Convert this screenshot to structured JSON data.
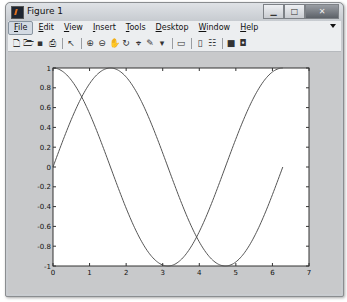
{
  "window": {
    "title": "Figure 1",
    "controls": {
      "minimize": "minimize-button",
      "maximize": "maximize-button",
      "close": "close-button"
    }
  },
  "menubar": {
    "items": [
      {
        "label": "File",
        "mnemonic": "F",
        "rest": "ile",
        "active": true
      },
      {
        "label": "Edit",
        "mnemonic": "E",
        "rest": "dit"
      },
      {
        "label": "View",
        "mnemonic": "V",
        "rest": "iew"
      },
      {
        "label": "Insert",
        "mnemonic": "I",
        "rest": "nsert"
      },
      {
        "label": "Tools",
        "mnemonic": "T",
        "rest": "ools"
      },
      {
        "label": "Desktop",
        "mnemonic": "D",
        "rest": "esktop"
      },
      {
        "label": "Window",
        "mnemonic": "W",
        "rest": "indow"
      },
      {
        "label": "Help",
        "mnemonic": "H",
        "rest": "elp"
      }
    ]
  },
  "toolbar": {
    "buttons": [
      {
        "name": "new-figure-icon",
        "glyph": "🗋"
      },
      {
        "name": "open-file-icon",
        "glyph": "🗁"
      },
      {
        "name": "save-figure-icon",
        "glyph": "▪"
      },
      {
        "name": "print-figure-icon",
        "glyph": "⎙"
      },
      {
        "sep": true
      },
      {
        "name": "edit-plot-icon",
        "glyph": "↖"
      },
      {
        "sep": true
      },
      {
        "name": "zoom-in-icon",
        "glyph": "⊕"
      },
      {
        "name": "zoom-out-icon",
        "glyph": "⊖"
      },
      {
        "name": "pan-icon",
        "glyph": "✋"
      },
      {
        "name": "rotate-3d-icon",
        "glyph": "↻"
      },
      {
        "name": "data-cursor-icon",
        "glyph": "⌖"
      },
      {
        "name": "brush-icon",
        "glyph": "✎"
      },
      {
        "name": "brush-dropdown-icon",
        "glyph": "▾"
      },
      {
        "sep": true
      },
      {
        "name": "link-plot-icon",
        "glyph": "▭"
      },
      {
        "sep": true
      },
      {
        "name": "insert-colorbar-icon",
        "glyph": "▯"
      },
      {
        "name": "insert-legend-icon",
        "glyph": "☷"
      },
      {
        "sep": true
      },
      {
        "name": "hide-plot-tools-icon",
        "glyph": "■"
      },
      {
        "name": "show-plot-tools-icon",
        "glyph": "◘"
      }
    ]
  },
  "chart_data": {
    "type": "line",
    "title": "",
    "xlabel": "",
    "ylabel": "",
    "xlim": [
      0,
      7
    ],
    "ylim": [
      -1,
      1
    ],
    "grid": false,
    "legend": null,
    "xticks": [
      "0",
      "1",
      "2",
      "3",
      "4",
      "5",
      "6",
      "7"
    ],
    "yticks": [
      "-1",
      "-0.8",
      "-0.6",
      "-0.4",
      "-0.2",
      "0",
      "0.2",
      "0.4",
      "0.6",
      "0.8",
      "1"
    ],
    "series": [
      {
        "name": "sin(x)",
        "x_range": [
          0,
          6.2832
        ],
        "x": [
          0,
          0.785,
          1.571,
          2.356,
          3.142,
          3.927,
          4.712,
          5.498,
          6.283
        ],
        "values": [
          0,
          0.707,
          1,
          0.707,
          0,
          -0.707,
          -1,
          -0.707,
          0
        ],
        "color": "#555555"
      },
      {
        "name": "cos(x)",
        "x_range": [
          0,
          6.2832
        ],
        "x": [
          0,
          0.785,
          1.571,
          2.356,
          3.142,
          3.927,
          4.712,
          5.498,
          6.283
        ],
        "values": [
          1,
          0.707,
          0,
          -0.707,
          -1,
          -0.707,
          0,
          0.707,
          1
        ],
        "color": "#555555"
      }
    ]
  },
  "colors": {
    "figure_bg": "#c8c9cb",
    "axes_bg": "#ffffff",
    "line": "#555555"
  }
}
